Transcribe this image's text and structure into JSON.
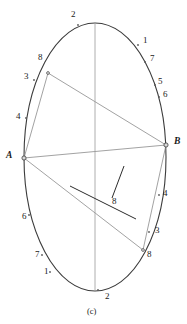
{
  "figure": {
    "caption": "(c)",
    "colors": {
      "outline": "#3b3b3b",
      "chord_gray": "#8a8a8a",
      "axis_gray": "#9a9a9a",
      "accent_dark": "#2b2b2b",
      "text": "#1a1a1a",
      "background": "#ffffff"
    },
    "ellipse": {
      "cx": 95,
      "cy": 157,
      "rx": 71,
      "ry": 134
    },
    "points": {
      "A": {
        "x": 24,
        "y": 158,
        "label": "A"
      },
      "B": {
        "x": 166,
        "y": 145,
        "label": "B"
      },
      "top_eight": {
        "x": 48,
        "y": 73,
        "label": "8"
      },
      "bottom_eight": {
        "x": 143,
        "y": 250,
        "label": "8"
      },
      "pointer_eight": {
        "x": 113,
        "y": 201,
        "label": "8"
      }
    },
    "tick_labels": [
      {
        "text": "2",
        "x": 71,
        "y": 14,
        "name": "tick-label-2-top",
        "dot_x": 78,
        "dot_y": 25
      },
      {
        "text": "1",
        "x": 143,
        "y": 40,
        "name": "tick-label-1-upper-right",
        "dot_x": 138,
        "dot_y": 45
      },
      {
        "text": "7",
        "x": 150,
        "y": 58,
        "name": "tick-label-7-upper-right",
        "dot_x": 145,
        "dot_y": 62
      },
      {
        "text": "5",
        "x": 158,
        "y": 81,
        "name": "tick-label-5-upper-right",
        "dot_x": 155,
        "dot_y": 85
      },
      {
        "text": "6",
        "x": 163,
        "y": 94,
        "name": "tick-label-6-upper-right",
        "dot_x": 159,
        "dot_y": 97
      },
      {
        "text": "B",
        "x": 174,
        "y": 141,
        "name": "point-label-B",
        "dot_x": 166,
        "dot_y": 145
      },
      {
        "text": "4",
        "x": 163,
        "y": 193,
        "name": "tick-label-4-lower-right",
        "dot_x": 159,
        "dot_y": 195
      },
      {
        "text": "3",
        "x": 155,
        "y": 230,
        "name": "tick-label-3-lower-right",
        "dot_x": 149,
        "dot_y": 232
      },
      {
        "text": "8",
        "x": 147,
        "y": 254,
        "name": "tick-label-8-lower-right",
        "dot_x": 143,
        "dot_y": 250
      },
      {
        "text": "2",
        "x": 105,
        "y": 296,
        "name": "tick-label-2-bottom",
        "dot_x": 98,
        "dot_y": 290
      },
      {
        "text": "1",
        "x": 44,
        "y": 271,
        "name": "tick-label-1-lower-left",
        "dot_x": 50,
        "dot_y": 272
      },
      {
        "text": "7",
        "x": 35,
        "y": 254,
        "name": "tick-label-7-lower-left",
        "dot_x": 42,
        "dot_y": 255
      },
      {
        "text": "6",
        "x": 22,
        "y": 216,
        "name": "tick-label-6-lower-left",
        "dot_x": 29,
        "dot_y": 215
      },
      {
        "text": "A",
        "x": 8,
        "y": 155,
        "name": "point-label-A",
        "dot_x": 24,
        "dot_y": 158
      },
      {
        "text": "4",
        "x": 16,
        "y": 116,
        "name": "tick-label-4-upper-left",
        "dot_x": 26,
        "dot_y": 118
      },
      {
        "text": "3",
        "x": 24,
        "y": 76,
        "name": "tick-label-3-upper-left",
        "dot_x": 34,
        "dot_y": 80
      },
      {
        "text": "8",
        "x": 38,
        "y": 57,
        "name": "tick-label-8-upper-left",
        "dot_x": 48,
        "dot_y": 73
      }
    ],
    "segments": [
      {
        "name": "chord-A-to-B",
        "x1": 24,
        "y1": 158,
        "x2": 166,
        "y2": 145,
        "style": "gray"
      },
      {
        "name": "chord-top8-to-A",
        "x1": 48,
        "y1": 73,
        "x2": 24,
        "y2": 158,
        "style": "gray"
      },
      {
        "name": "chord-top8-to-B",
        "x1": 48,
        "y1": 73,
        "x2": 166,
        "y2": 145,
        "style": "gray"
      },
      {
        "name": "chord-bottom8-to-A",
        "x1": 143,
        "y1": 250,
        "x2": 24,
        "y2": 158,
        "style": "gray"
      },
      {
        "name": "chord-bottom8-to-B",
        "x1": 143,
        "y1": 250,
        "x2": 166,
        "y2": 145,
        "style": "gray"
      },
      {
        "name": "vertical-axis",
        "x1": 95,
        "y1": 23,
        "x2": 95,
        "y2": 290,
        "style": "axis"
      },
      {
        "name": "dark-diagonal-segment",
        "x1": 70,
        "y1": 186,
        "x2": 136,
        "y2": 219,
        "style": "dark"
      },
      {
        "name": "leader-line-eight",
        "x1": 112,
        "y1": 198,
        "x2": 124,
        "y2": 166,
        "style": "dark"
      }
    ]
  }
}
